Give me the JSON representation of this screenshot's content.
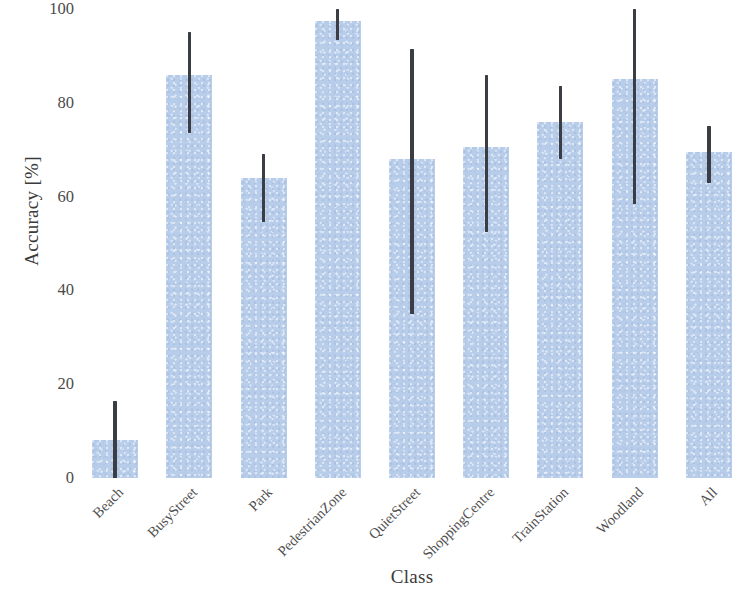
{
  "chart_data": {
    "type": "bar",
    "title": "",
    "xlabel": "Class",
    "ylabel": "Accuracy [%]",
    "ylim": [
      0,
      100
    ],
    "yticks": [
      0,
      20,
      40,
      60,
      80,
      100
    ],
    "ytick_labels": [
      "0",
      "20",
      "40",
      "60",
      "80",
      "100"
    ],
    "grid": false,
    "legend": null,
    "bar_color": "#b8cdea",
    "errorbar_color": "#3a3d44",
    "xtick_rotation": -45,
    "categories": [
      "Beach",
      "BusyStreet",
      "Park",
      "PedestrianZone",
      "QuietStreet",
      "ShoppingCentre",
      "TrainStation",
      "Woodland",
      "All"
    ],
    "values": [
      8,
      86,
      64,
      97.5,
      68,
      70.5,
      76,
      85,
      69.5
    ],
    "error_low": [
      0,
      73.5,
      54.5,
      93.5,
      35,
      52.5,
      68,
      58.5,
      63
    ],
    "error_high": [
      16.5,
      95,
      69,
      100,
      91.5,
      86,
      83.5,
      100,
      75
    ],
    "series": [
      {
        "name": "Accuracy",
        "values": [
          8,
          86,
          64,
          97.5,
          68,
          70.5,
          76,
          85,
          69.5
        ]
      }
    ]
  }
}
